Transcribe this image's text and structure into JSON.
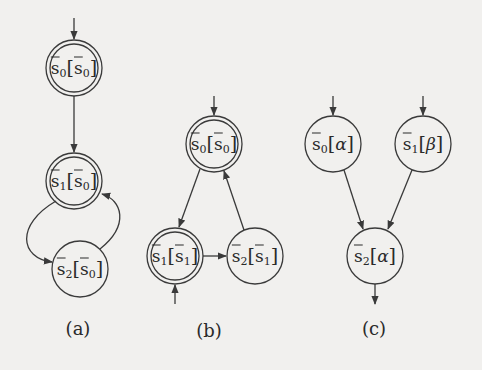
{
  "colors": {
    "background": "#f1f0ee",
    "stroke": "#3a3a3a",
    "text": "#2a2a2a"
  },
  "panels": [
    {
      "id": "a",
      "label": "(a)",
      "nodes": [
        {
          "id": "a0",
          "state": "s",
          "index": "0",
          "bracket_state": "s",
          "bracket_index": "0",
          "bracket_bar": true,
          "accepting": true,
          "initial": true
        },
        {
          "id": "a1",
          "state": "s",
          "index": "1",
          "bracket_state": "s",
          "bracket_index": "0",
          "bracket_bar": true,
          "accepting": true,
          "initial": false
        },
        {
          "id": "a2",
          "state": "s",
          "index": "2",
          "bracket_state": "s",
          "bracket_index": "0",
          "bracket_bar": true,
          "accepting": false,
          "initial": false
        }
      ],
      "edges": [
        {
          "from": "a0",
          "to": "a1"
        },
        {
          "from": "a1",
          "to": "a2"
        },
        {
          "from": "a2",
          "to": "a1"
        }
      ]
    },
    {
      "id": "b",
      "label": "(b)",
      "nodes": [
        {
          "id": "b0",
          "state": "s",
          "index": "0",
          "bracket_state": "s",
          "bracket_index": "0",
          "bracket_bar": true,
          "accepting": true,
          "initial": true
        },
        {
          "id": "b1",
          "state": "s",
          "index": "1",
          "bracket_state": "s",
          "bracket_index": "1",
          "bracket_bar": true,
          "accepting": true,
          "initial": true
        },
        {
          "id": "b2",
          "state": "s",
          "index": "2",
          "bracket_state": "s",
          "bracket_index": "1",
          "bracket_bar": true,
          "accepting": false,
          "initial": false
        }
      ],
      "edges": [
        {
          "from": "b0",
          "to": "b1"
        },
        {
          "from": "b1",
          "to": "b2"
        },
        {
          "from": "b2",
          "to": "b0"
        }
      ]
    },
    {
      "id": "c",
      "label": "(c)",
      "nodes": [
        {
          "id": "c0",
          "state": "s",
          "index": "0",
          "bracket_symbol": "α",
          "accepting": false,
          "initial": true
        },
        {
          "id": "c1",
          "state": "s",
          "index": "1",
          "bracket_symbol": "β",
          "accepting": false,
          "initial": true
        },
        {
          "id": "c2",
          "state": "s",
          "index": "2",
          "bracket_symbol": "α",
          "accepting": false,
          "initial": false,
          "outgoing_exit": true
        }
      ],
      "edges": [
        {
          "from": "c0",
          "to": "c2"
        },
        {
          "from": "c1",
          "to": "c2"
        }
      ]
    }
  ]
}
